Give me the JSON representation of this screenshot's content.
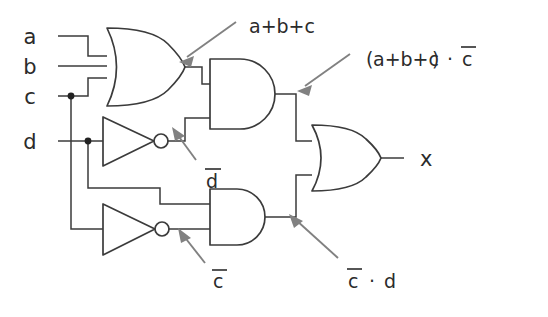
{
  "diagram": {
    "type": "logic-gate-schematic",
    "colors": {
      "wire": "#3b3b3b",
      "gate": "#3b3b3b",
      "annotation_arrow": "#818181",
      "text": "#2b2b2b",
      "background": "#ffffff"
    },
    "inputs": [
      {
        "id": "a",
        "label": "a"
      },
      {
        "id": "b",
        "label": "b"
      },
      {
        "id": "c",
        "label": "c"
      },
      {
        "id": "d",
        "label": "d"
      }
    ],
    "outputs": [
      {
        "id": "x",
        "label": "x"
      }
    ],
    "gates": [
      {
        "id": "or1",
        "type": "OR",
        "inputs": [
          "a",
          "b",
          "c"
        ],
        "output_expr": "a+b+c"
      },
      {
        "id": "not1",
        "type": "NOT",
        "inputs": [
          "d"
        ],
        "output_expr": "d̄"
      },
      {
        "id": "not2",
        "type": "NOT",
        "inputs": [
          "c"
        ],
        "output_expr": "c̄"
      },
      {
        "id": "and1",
        "type": "AND",
        "inputs": [
          "or1",
          "not1"
        ],
        "output_expr": "(a+b+c) · c̄"
      },
      {
        "id": "and2",
        "type": "AND",
        "inputs": [
          "d",
          "not2"
        ],
        "output_expr": "c̄ · d"
      },
      {
        "id": "or2",
        "type": "OR",
        "inputs": [
          "and1",
          "and2"
        ],
        "output_expr": "x"
      }
    ],
    "annotations": [
      {
        "id": "ann-or1-out",
        "text": "a+b+c",
        "target": "or1-output-wire"
      },
      {
        "id": "ann-and1-out",
        "text_plain": "(a+b+c) · c̄",
        "target": "and1-output-wire"
      },
      {
        "id": "ann-not1-out",
        "text_plain": "d̄",
        "target": "and1-lower-input-wire"
      },
      {
        "id": "ann-not2-out",
        "text_plain": "c̄",
        "target": "not2-bubble-output"
      },
      {
        "id": "ann-and2-out",
        "text_plain": "c̄ · d",
        "target": "and2-output-wire"
      }
    ],
    "labels": {
      "input_a": "a",
      "input_b": "b",
      "input_c": "c",
      "input_d": "d",
      "output_x": "x",
      "expr_or1": "a+b+c",
      "expr_and1_open": "(",
      "expr_and1_inner": "a+b+c",
      "expr_and1_close": ")",
      "expr_and1_dot": "·",
      "expr_and1_cbar": "c",
      "expr_dbar": "d",
      "expr_cbar": "c",
      "expr_and2_cbar": "c",
      "expr_and2_dot": "·",
      "expr_and2_d": "d"
    }
  }
}
